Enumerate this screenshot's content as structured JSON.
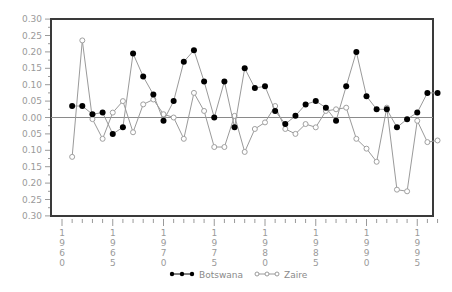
{
  "chart_data": {
    "type": "line",
    "title": "",
    "xlabel": "",
    "ylabel": "",
    "ylim": [
      -0.3,
      0.3
    ],
    "xlim": [
      1959,
      1998.5
    ],
    "grid": false,
    "zero_line": true,
    "legend_position": "bottom",
    "y_ticks": [
      "0.30",
      "0.25",
      "0.20",
      "0.15",
      "0.10",
      "0.05",
      "0.00",
      "0.05",
      "0.10",
      "0.15",
      "0.20",
      "0.25",
      "0.30"
    ],
    "y_tick_values": [
      0.3,
      0.25,
      0.2,
      0.15,
      0.1,
      0.05,
      0.0,
      -0.05,
      -0.1,
      -0.15,
      -0.2,
      -0.25,
      -0.3
    ],
    "x_ticks": [
      "1960",
      "1965",
      "1970",
      "1975",
      "1980",
      "1985",
      "1990",
      "1995"
    ],
    "x_tick_values": [
      1960,
      1965,
      1970,
      1975,
      1980,
      1985,
      1990,
      1995
    ],
    "x": [
      1961,
      1962,
      1963,
      1964,
      1965,
      1966,
      1967,
      1968,
      1969,
      1970,
      1971,
      1972,
      1973,
      1974,
      1975,
      1976,
      1977,
      1978,
      1979,
      1980,
      1981,
      1982,
      1983,
      1984,
      1985,
      1986,
      1987,
      1988,
      1989,
      1990,
      1991,
      1992,
      1993,
      1994,
      1995,
      1996,
      1997
    ],
    "series": [
      {
        "name": "Botswana",
        "marker": "filled-circle",
        "color": "#000000",
        "line_color": "#9a9a9a",
        "values": [
          0.035,
          0.035,
          0.01,
          0.015,
          -0.05,
          -0.03,
          0.195,
          0.125,
          0.07,
          -0.01,
          0.05,
          0.17,
          0.205,
          0.11,
          0.0,
          0.11,
          -0.03,
          0.15,
          0.09,
          0.095,
          0.02,
          -0.02,
          0.005,
          0.04,
          0.05,
          0.03,
          -0.01,
          0.095,
          0.2,
          0.065,
          0.025,
          0.025,
          -0.03,
          -0.005,
          0.015,
          0.075,
          0.075
        ]
      },
      {
        "name": "Zaire",
        "marker": "open-diamond-circle",
        "color": "#9a9a9a",
        "line_color": "#9a9a9a",
        "values": [
          -0.12,
          0.235,
          -0.005,
          -0.065,
          0.015,
          0.05,
          -0.045,
          0.04,
          0.055,
          0.01,
          0.0,
          -0.065,
          0.075,
          0.02,
          -0.09,
          -0.09,
          0.005,
          -0.105,
          -0.035,
          -0.015,
          0.035,
          -0.035,
          -0.05,
          -0.02,
          -0.03,
          0.02,
          0.025,
          0.03,
          -0.065,
          -0.095,
          -0.135,
          0.03,
          -0.22,
          -0.225,
          -0.01,
          -0.075,
          -0.07
        ]
      }
    ]
  },
  "legend": {
    "items": [
      {
        "label": "Botswana"
      },
      {
        "label": "Zaire"
      }
    ]
  }
}
